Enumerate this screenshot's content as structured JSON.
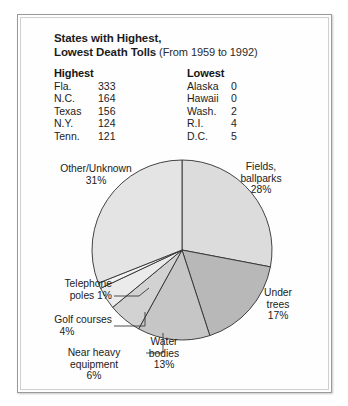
{
  "figure": {
    "title_line1": "States with Highest,",
    "title_line2": "Lowest Death Tolls",
    "title_subtitle": "(From 1959 to 1992)"
  },
  "table": {
    "columns": [
      {
        "header": "Highest",
        "rows": [
          {
            "state": "Fla.",
            "value": "333"
          },
          {
            "state": "N.C.",
            "value": "164"
          },
          {
            "state": "Texas",
            "value": "156"
          },
          {
            "state": "N.Y.",
            "value": "124"
          },
          {
            "state": "Tenn.",
            "value": "121"
          }
        ]
      },
      {
        "header": "Lowest",
        "rows": [
          {
            "state": "Alaska",
            "value": "0"
          },
          {
            "state": "Hawaii",
            "value": "0"
          },
          {
            "state": "Wash.",
            "value": "2"
          },
          {
            "state": "R.I.",
            "value": "4"
          },
          {
            "state": "D.C.",
            "value": "5"
          }
        ]
      }
    ]
  },
  "chart_data": {
    "type": "pie",
    "title": "",
    "legend": "callout-labels",
    "start_angle_deg": 0,
    "direction": "clockwise",
    "categories": [
      "Fields, ballparks",
      "Under trees",
      "Water bodies",
      "Near heavy equipment",
      "Golf courses",
      "Telephone poles",
      "Other/Unknown"
    ],
    "values": [
      28,
      17,
      13,
      6,
      4,
      1,
      31
    ],
    "unit": "percent",
    "total": 100,
    "slices": [
      {
        "label": "Fields, ballparks",
        "label_line1": "Fields,",
        "label_line2": "ballparks",
        "value": 28,
        "pct_text": "28%",
        "color": "#dcdcdc"
      },
      {
        "label": "Under trees",
        "label_line1": "Under",
        "label_line2": "trees",
        "value": 17,
        "pct_text": "17%",
        "color": "#b8b8b8"
      },
      {
        "label": "Water bodies",
        "label_line1": "Water",
        "label_line2": "bodies",
        "value": 13,
        "pct_text": "13%",
        "color": "#c6c6c6"
      },
      {
        "label": "Near heavy equipment",
        "label_line1": "Near heavy",
        "label_line2": "equipment",
        "value": 6,
        "pct_text": "6%",
        "color": "#d2d2d2"
      },
      {
        "label": "Golf courses",
        "label_line1": "Golf courses",
        "label_line2": "",
        "value": 4,
        "pct_text": "4%",
        "color": "#ebebeb"
      },
      {
        "label": "Telephone poles",
        "label_line1": "Telephone",
        "label_line2": "poles 1%",
        "value": 1,
        "pct_text": "1%",
        "color": "#f3f3f3"
      },
      {
        "label": "Other/Unknown",
        "label_line1": "Other/Unknown",
        "label_line2": "",
        "value": 31,
        "pct_text": "31%",
        "color": "#e4e4e4"
      }
    ]
  }
}
